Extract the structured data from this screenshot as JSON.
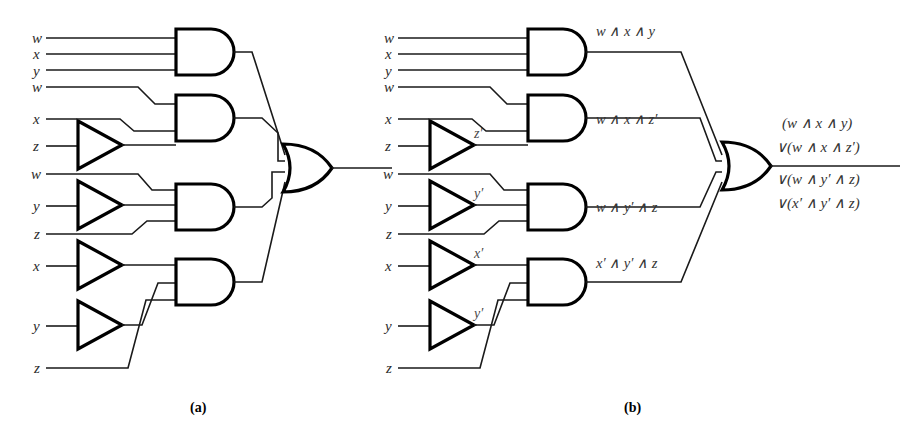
{
  "figure": {
    "captions": {
      "a": "(a)",
      "b": "(b)"
    }
  },
  "diagram_a": {
    "name": "circuit-unlabeled",
    "inputs": [
      {
        "label": "w",
        "y": 38
      },
      {
        "label": "x",
        "y": 54
      },
      {
        "label": "y",
        "y": 70
      },
      {
        "label": "w",
        "y": 87
      },
      {
        "label": "x",
        "y": 119
      },
      {
        "label": "z",
        "y": 146
      },
      {
        "label": "w",
        "y": 174
      },
      {
        "label": "y",
        "y": 206
      },
      {
        "label": "z",
        "y": 234
      },
      {
        "label": "x",
        "y": 266
      },
      {
        "label": "y",
        "y": 326
      },
      {
        "label": "z",
        "y": 368
      }
    ],
    "inverter_count": 4,
    "and_gate_count": 4,
    "or_gate_count": 1
  },
  "diagram_b": {
    "name": "circuit-labeled",
    "inputs": [
      {
        "label": "w",
        "y": 38
      },
      {
        "label": "x",
        "y": 54
      },
      {
        "label": "y",
        "y": 70
      },
      {
        "label": "w",
        "y": 87
      },
      {
        "label": "x",
        "y": 119
      },
      {
        "label": "z",
        "y": 146
      },
      {
        "label": "w",
        "y": 174
      },
      {
        "label": "y",
        "y": 206
      },
      {
        "label": "z",
        "y": 234
      },
      {
        "label": "x",
        "y": 266
      },
      {
        "label": "y",
        "y": 326
      },
      {
        "label": "z",
        "y": 368
      }
    ],
    "inverter_outputs": [
      {
        "label": "z′",
        "y": 133
      },
      {
        "label": "y′",
        "y": 193
      },
      {
        "label": "x′",
        "y": 253
      },
      {
        "label": "y′",
        "y": 313
      }
    ],
    "and_outputs": [
      {
        "label": "w ∧ x ∧ y",
        "y": 36
      },
      {
        "label": "w ∧ x ∧ z′",
        "y": 124
      },
      {
        "label": "w ∧ y′ ∧ z",
        "y": 212
      },
      {
        "label": "x′ ∧ y′ ∧ z",
        "y": 268
      }
    ],
    "or_output_expression": [
      "(w ∧ x ∧ y)",
      "∨(w ∧ x ∧ z′)",
      "∨(w ∧ y′ ∧ z)",
      "∨(x′ ∧ y′ ∧ z)"
    ],
    "inverter_count": 4,
    "and_gate_count": 4,
    "or_gate_count": 1
  },
  "colors": {
    "wire": "#1a1a1a",
    "gate_outline": "#000000",
    "gate_fill": "#ffffff",
    "text": "#2b2b2b",
    "background": "#ffffff"
  }
}
